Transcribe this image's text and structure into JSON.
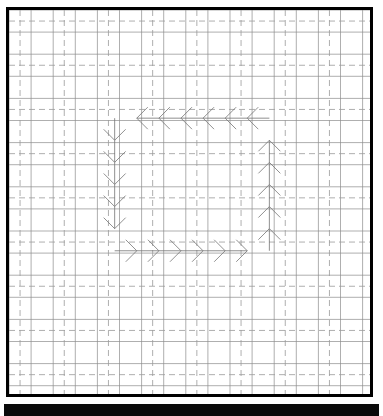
{
  "figure": {
    "title": "",
    "background_color": "#ffffff",
    "frame_color": "#000000",
    "frame_width_px": 3,
    "bottom_bar_color": "#0a0a0a"
  },
  "grid": {
    "minor_color": "#8c8c8c",
    "major_color": "#9a9a9a",
    "minor_step_px": 22.1,
    "major_step_px": 44.2,
    "major_dash": "6,4",
    "minor_line_width": 0.7,
    "major_line_width": 0.8,
    "columns": 16,
    "rows": 17,
    "show_minor": true,
    "show_major_dashed": true
  },
  "chart_data": {
    "type": "quiver",
    "title": "",
    "subtitle": "",
    "xlabel": "",
    "ylabel": "",
    "xlim": [
      0,
      16
    ],
    "ylim": [
      0,
      17
    ],
    "xticks": [],
    "yticks": [],
    "grid": true,
    "legend": null,
    "annotations": [],
    "arrow_style": {
      "color": "#737373",
      "line_width": 0.8,
      "head_length_px": 11,
      "head_half_width_px": 11,
      "shaft_length_px": 22.1,
      "head_only": false
    },
    "cell_px": 22.1,
    "origin_px": [
      4,
      4
    ],
    "series": [
      {
        "name": "top-row-left",
        "direction": "left",
        "u": -1,
        "v": 0,
        "count": 6,
        "points": [
          {
            "x": 10.6,
            "y": 12.3
          },
          {
            "x": 9.6,
            "y": 12.3
          },
          {
            "x": 8.6,
            "y": 12.3
          },
          {
            "x": 7.6,
            "y": 12.3
          },
          {
            "x": 6.6,
            "y": 12.3
          },
          {
            "x": 5.6,
            "y": 12.3
          }
        ]
      },
      {
        "name": "left-column-down",
        "direction": "down",
        "u": 0,
        "v": -1,
        "count": 5,
        "points": [
          {
            "x": 4.6,
            "y": 11.3
          },
          {
            "x": 4.6,
            "y": 10.3
          },
          {
            "x": 4.6,
            "y": 9.3
          },
          {
            "x": 4.6,
            "y": 8.3
          },
          {
            "x": 4.6,
            "y": 7.3
          }
        ]
      },
      {
        "name": "bottom-row-right",
        "direction": "right",
        "u": 1,
        "v": 0,
        "count": 6,
        "points": [
          {
            "x": 5.6,
            "y": 6.3
          },
          {
            "x": 6.6,
            "y": 6.3
          },
          {
            "x": 7.6,
            "y": 6.3
          },
          {
            "x": 8.6,
            "y": 6.3
          },
          {
            "x": 9.6,
            "y": 6.3
          },
          {
            "x": 10.6,
            "y": 6.3
          }
        ]
      },
      {
        "name": "right-column-up",
        "direction": "up",
        "u": 0,
        "v": 1,
        "count": 5,
        "points": [
          {
            "x": 11.6,
            "y": 7.3
          },
          {
            "x": 11.6,
            "y": 8.3
          },
          {
            "x": 11.6,
            "y": 9.3
          },
          {
            "x": 11.6,
            "y": 10.3
          },
          {
            "x": 11.6,
            "y": 11.3
          }
        ]
      }
    ]
  }
}
